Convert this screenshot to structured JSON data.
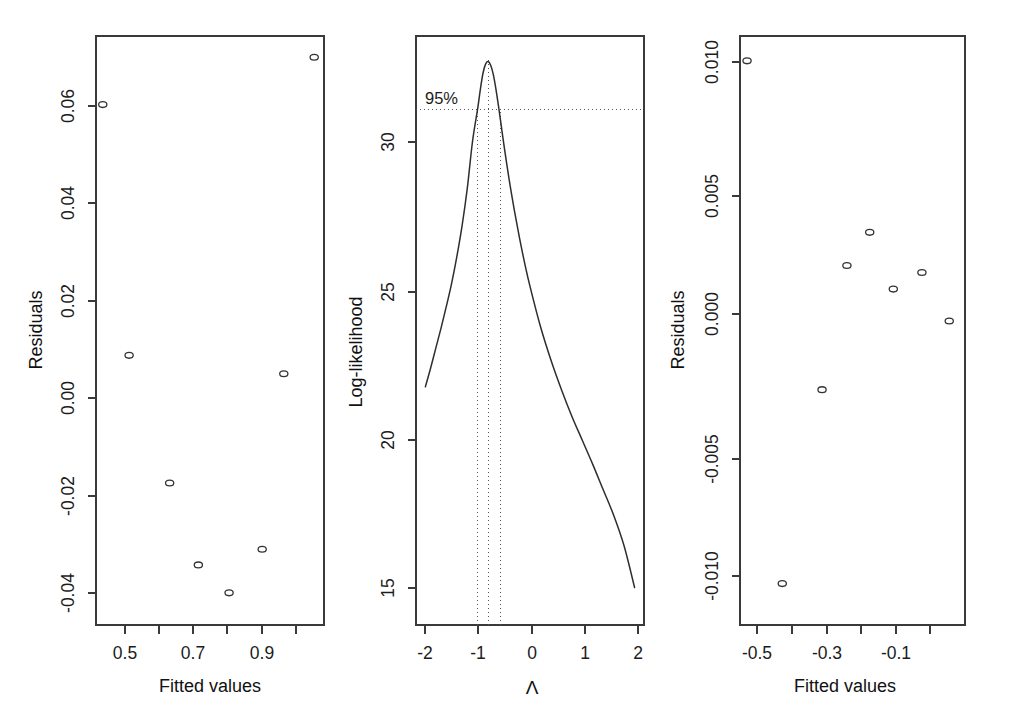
{
  "figure": {
    "kind": "multi-panel-r-diagnostic-figure",
    "panel_count": 3,
    "background_color": "#ffffff",
    "ink_color": "#333333"
  },
  "chart_data": [
    {
      "id": "panel-1",
      "type": "scatter",
      "title": "",
      "xlabel": "Fitted values",
      "ylabel": "Residuals",
      "xlim": [
        0.432,
        1.107
      ],
      "ylim": [
        -0.0505,
        0.074
      ],
      "grid": false,
      "legend": "none",
      "xticks": [
        0.5,
        0.6,
        0.7,
        0.8,
        0.9,
        1.0
      ],
      "xticklabels": [
        "0.5",
        "",
        "0.7",
        "",
        "0.9",
        ""
      ],
      "yticks": [
        0.06,
        0.04,
        0.02,
        0.0,
        -0.02,
        -0.04
      ],
      "yticklabels": [
        "0.06",
        "0.04",
        "0.02",
        "0.00",
        "-0.02",
        "-0.04"
      ],
      "marker": "open-circle",
      "points": [
        {
          "x": 0.452,
          "y": 0.0595
        },
        {
          "x": 0.53,
          "y": 0.0065
        },
        {
          "x": 0.65,
          "y": -0.0205
        },
        {
          "x": 0.735,
          "y": -0.0378
        },
        {
          "x": 0.826,
          "y": -0.0437
        },
        {
          "x": 0.924,
          "y": -0.0345
        },
        {
          "x": 0.988,
          "y": 0.0026
        },
        {
          "x": 1.078,
          "y": 0.0695
        }
      ]
    },
    {
      "id": "panel-2",
      "type": "line",
      "title": "",
      "xlabel": "Λ",
      "ylabel": "Log-likelihood",
      "xlim": [
        -2.18,
        2.18
      ],
      "ylim": [
        11.6,
        33.6
      ],
      "grid": false,
      "legend": "none",
      "xticks": [
        -2,
        -1,
        0,
        1,
        2
      ],
      "xticklabels": [
        "-2",
        "-1",
        "0",
        "1",
        "2"
      ],
      "yticks": [
        30,
        25,
        20,
        15
      ],
      "yticklabels": [
        "30",
        "25",
        "20",
        "15"
      ],
      "annotations": [
        {
          "text": "95%",
          "x": -2.02,
          "y": 31.6
        }
      ],
      "reference_lines": {
        "horizontal_95pct": 30.84,
        "vertical_mle": -0.8,
        "vertical_ci_lower": -1.0,
        "vertical_ci_upper": -0.56
      },
      "series": [
        {
          "name": "profile log-likelihood",
          "x": [
            -2.0,
            -1.9,
            -1.8,
            -1.7,
            -1.6,
            -1.5,
            -1.4,
            -1.3,
            -1.2,
            -1.1,
            -1.0,
            -0.95,
            -0.9,
            -0.85,
            -0.8,
            -0.75,
            -0.7,
            -0.65,
            -0.6,
            -0.55,
            -0.5,
            -0.4,
            -0.3,
            -0.2,
            -0.1,
            0.0,
            0.2,
            0.4,
            0.6,
            0.8,
            1.0,
            1.2,
            1.4,
            1.6,
            1.8,
            2.0
          ],
          "y": [
            20.5,
            21.2,
            21.95,
            22.7,
            23.5,
            24.35,
            25.35,
            26.5,
            27.9,
            29.65,
            30.9,
            31.6,
            32.2,
            32.55,
            32.65,
            32.5,
            32.15,
            31.6,
            30.95,
            30.25,
            29.55,
            28.25,
            27.1,
            26.05,
            25.1,
            24.25,
            22.75,
            21.5,
            20.4,
            19.4,
            18.5,
            17.6,
            16.65,
            15.7,
            14.55,
            13.0
          ]
        }
      ]
    },
    {
      "id": "panel-3",
      "type": "scatter",
      "title": "",
      "xlabel": "Fitted values",
      "ylabel": "Residuals",
      "xlim": [
        -0.545,
        -0.002
      ],
      "ylim": [
        -0.0136,
        0.0113
      ],
      "grid": false,
      "legend": "none",
      "xticks": [
        -0.5,
        -0.4,
        -0.3,
        -0.2,
        -0.1,
        0.0
      ],
      "xticklabels": [
        "-0.5",
        "",
        "-0.3",
        "",
        "-0.1",
        ""
      ],
      "yticks": [
        0.01,
        0.005,
        0.0,
        -0.005,
        -0.01
      ],
      "yticklabels": [
        "0.010",
        "0.005",
        "0.000",
        "-0.005",
        "-0.010"
      ],
      "marker": "open-circle",
      "points": [
        {
          "x": -0.528,
          "y": 0.01025
        },
        {
          "x": -0.443,
          "y": -0.01185
        },
        {
          "x": -0.347,
          "y": -0.00365
        },
        {
          "x": -0.287,
          "y": 0.0016
        },
        {
          "x": -0.232,
          "y": 0.003
        },
        {
          "x": -0.175,
          "y": 0.0006
        },
        {
          "x": -0.106,
          "y": 0.0013
        },
        {
          "x": -0.04,
          "y": -0.00075
        }
      ]
    }
  ],
  "panel1": {
    "ylabel": "Residuals",
    "xlabel": "Fitted values",
    "ytick_labels": [
      "0.06",
      "0.04",
      "0.02",
      "0.00",
      "-0.02",
      "-0.04"
    ],
    "xtick_labels": [
      "0.5",
      "0.7",
      "0.9"
    ]
  },
  "panel2": {
    "ylabel": "Log-likelihood",
    "xlabel": "Λ",
    "ytick_labels": [
      "30",
      "25",
      "20",
      "15"
    ],
    "xtick_labels": [
      "-2",
      "-1",
      "0",
      "1",
      "2"
    ],
    "ci_label": "95%"
  },
  "panel3": {
    "ylabel": "Residuals",
    "xlabel": "Fitted values",
    "ytick_labels": [
      "0.010",
      "0.005",
      "0.000",
      "-0.005",
      "-0.010"
    ],
    "xtick_labels": [
      "-0.5",
      "-0.3",
      "-0.1"
    ]
  }
}
